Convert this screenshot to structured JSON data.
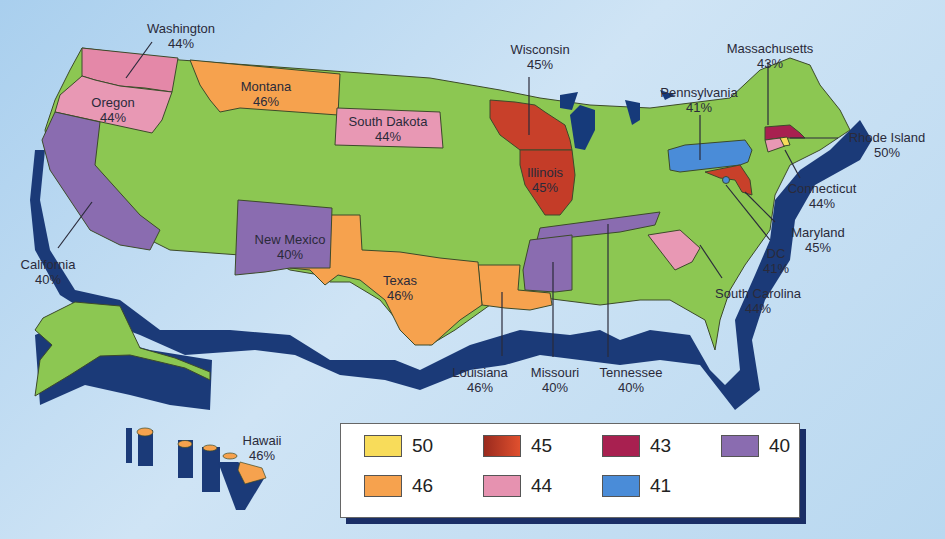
{
  "colors": {
    "ocean": "#c3ddf2",
    "base_state": "#8cc752",
    "extrusion": "#1b3a78",
    "lake": "#163a7a",
    "border": "#3c4a2a"
  },
  "legend": {
    "items": [
      {
        "value": "50",
        "color": "#f8dc5a"
      },
      {
        "value": "45",
        "color": "#c8402a"
      },
      {
        "value": "43",
        "color": "#a82050"
      },
      {
        "value": "40",
        "color": "#8a6cb0"
      },
      {
        "value": "46",
        "color": "#f6a24e"
      },
      {
        "value": "44",
        "color": "#e692b0"
      },
      {
        "value": "41",
        "color": "#4a8cd8"
      }
    ]
  },
  "states": [
    {
      "name": "Washington",
      "pct": "44%"
    },
    {
      "name": "Oregon",
      "pct": "44%"
    },
    {
      "name": "Montana",
      "pct": "46%"
    },
    {
      "name": "South Dakota",
      "pct": "44%"
    },
    {
      "name": "Wisconsin",
      "pct": "45%"
    },
    {
      "name": "Illinois",
      "pct": "45%"
    },
    {
      "name": "Massachusetts",
      "pct": "43%"
    },
    {
      "name": "Pennsylvania",
      "pct": "41%"
    },
    {
      "name": "Rhode Island",
      "pct": "50%"
    },
    {
      "name": "Connecticut",
      "pct": "44%"
    },
    {
      "name": "Maryland",
      "pct": "45%"
    },
    {
      "name": "DC",
      "pct": "41%"
    },
    {
      "name": "South Carolina",
      "pct": "44%"
    },
    {
      "name": "California",
      "pct": "40%"
    },
    {
      "name": "New Mexico",
      "pct": "40%"
    },
    {
      "name": "Texas",
      "pct": "46%"
    },
    {
      "name": "Louisiana",
      "pct": "46%"
    },
    {
      "name": "Missouri",
      "pct": "40%"
    },
    {
      "name": "Tennessee",
      "pct": "40%"
    },
    {
      "name": "Hawaii",
      "pct": "46%"
    }
  ]
}
